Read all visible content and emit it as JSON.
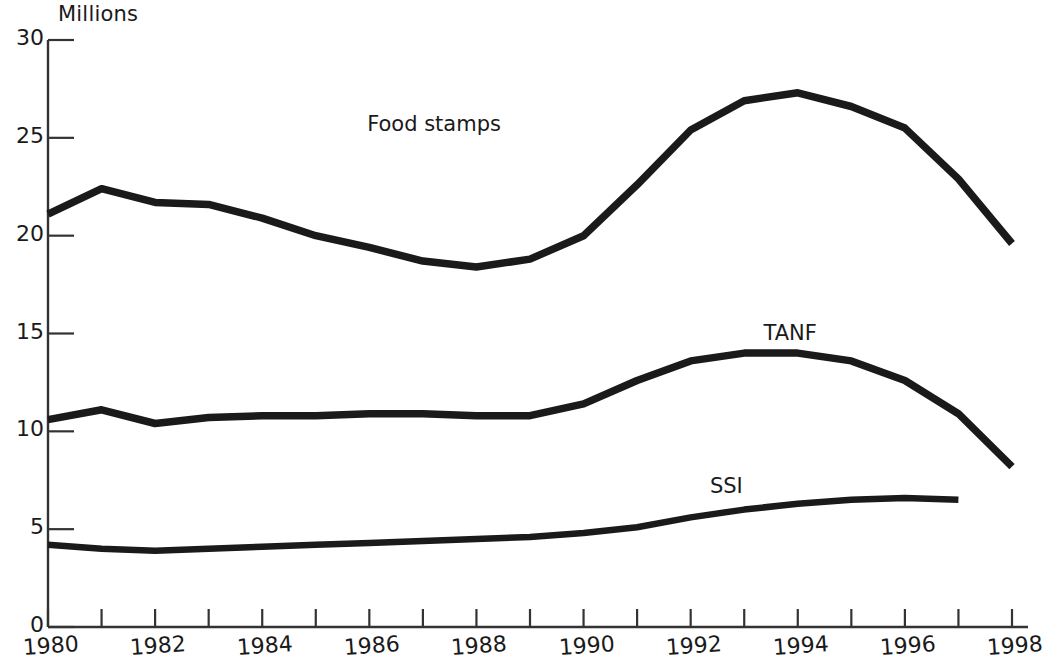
{
  "chart_data": {
    "type": "line",
    "title": "",
    "subtitle": "",
    "unit_label": "Millions",
    "xlabel": "",
    "ylabel": "",
    "xlim": [
      1980,
      1998
    ],
    "ylim": [
      0,
      30
    ],
    "y_ticks": [
      0,
      5,
      10,
      15,
      20,
      25,
      30
    ],
    "x_ticks": [
      1980,
      1981,
      1982,
      1983,
      1984,
      1985,
      1986,
      1987,
      1988,
      1989,
      1990,
      1991,
      1992,
      1993,
      1994,
      1995,
      1996,
      1997,
      1998
    ],
    "x_tick_labels": [
      "1980",
      "",
      "1982",
      "",
      "1984",
      "",
      "1986",
      "",
      "1988",
      "",
      "1990",
      "",
      "1992",
      "",
      "1994",
      "",
      "1996",
      "",
      "1998"
    ],
    "grid": false,
    "legend_position": "inline-annotations",
    "line_color": "#1a1a1a",
    "x": [
      1980,
      1981,
      1982,
      1983,
      1984,
      1985,
      1986,
      1987,
      1988,
      1989,
      1990,
      1991,
      1992,
      1993,
      1994,
      1995,
      1996,
      1997,
      1998
    ],
    "series": [
      {
        "name": "Food stamps",
        "label_x": 1988.2,
        "label_y": 25.6,
        "values": [
          21.1,
          22.4,
          21.7,
          21.6,
          20.9,
          20.0,
          19.4,
          18.7,
          18.4,
          18.8,
          20.0,
          22.6,
          25.4,
          26.9,
          27.3,
          26.6,
          25.5,
          22.9,
          19.6
        ]
      },
      {
        "name": "TANF",
        "label_x": 1995.6,
        "label_y": 14.9,
        "values": [
          10.6,
          11.1,
          10.4,
          10.7,
          10.8,
          10.8,
          10.9,
          10.9,
          10.8,
          10.8,
          11.4,
          12.6,
          13.6,
          14.0,
          14.0,
          13.6,
          12.6,
          10.9,
          8.2
        ]
      },
      {
        "name": "SSI",
        "label_x": 1994.6,
        "label_y": 7.1,
        "values": [
          4.2,
          4.0,
          3.9,
          4.0,
          4.1,
          4.2,
          4.3,
          4.4,
          4.5,
          4.6,
          4.8,
          5.1,
          5.6,
          6.0,
          6.3,
          6.5,
          6.6,
          6.5,
          null
        ]
      }
    ]
  }
}
